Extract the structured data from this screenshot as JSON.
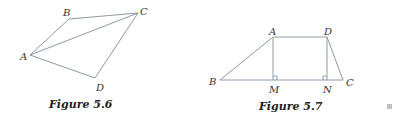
{
  "figures": [
    {
      "id": "fig-5-6",
      "caption": "Figure 5.6",
      "points": {
        "A": {
          "label": "A",
          "x": 30,
          "y": 55
        },
        "B": {
          "label": "B",
          "x": 69,
          "y": 19
        },
        "C": {
          "label": "C",
          "x": 138,
          "y": 13
        },
        "D": {
          "label": "D",
          "x": 95,
          "y": 78
        }
      },
      "segments": [
        "AB",
        "BC",
        "AC",
        "CD",
        "AD"
      ]
    },
    {
      "id": "fig-5-7",
      "caption": "Figure 5.7",
      "points": {
        "A": {
          "label": "A",
          "x": 273,
          "y": 37
        },
        "D": {
          "label": "D",
          "x": 327,
          "y": 37
        },
        "B": {
          "label": "B",
          "x": 220,
          "y": 80
        },
        "M": {
          "label": "M",
          "x": 273,
          "y": 80
        },
        "N": {
          "label": "N",
          "x": 327,
          "y": 80
        },
        "C": {
          "label": "C",
          "x": 343,
          "y": 80
        }
      },
      "segments": [
        "AB",
        "AD",
        "DC",
        "BC",
        "AM",
        "DN"
      ],
      "right_angles": [
        "M",
        "N"
      ]
    }
  ],
  "colors": {
    "line": "#8c9aa6",
    "text": "#333333",
    "marker": "#b8c0c8"
  }
}
